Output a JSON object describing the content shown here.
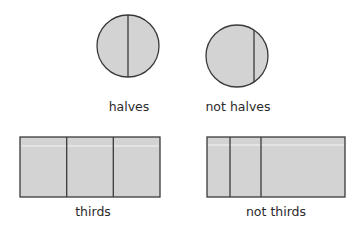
{
  "colors": {
    "fill": "#d3d3d3",
    "stroke": "#3a3a3a",
    "highlight": "#f4f4f4"
  },
  "figures": [
    {
      "id": "halves",
      "shape": "circle",
      "label": "halves",
      "parts": 2,
      "equal": true
    },
    {
      "id": "not-halves",
      "shape": "circle",
      "label": "not halves",
      "parts": 2,
      "equal": false
    },
    {
      "id": "thirds",
      "shape": "rectangle",
      "label": "thirds",
      "parts": 3,
      "equal": true
    },
    {
      "id": "not-thirds",
      "shape": "rectangle",
      "label": "not thirds",
      "parts": 3,
      "equal": false
    }
  ]
}
